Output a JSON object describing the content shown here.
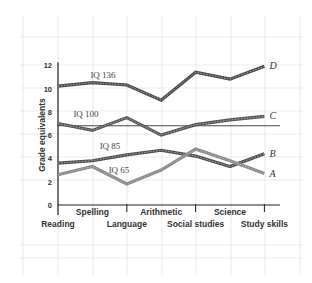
{
  "chart_data": {
    "type": "line",
    "title": "",
    "xlabel": "",
    "ylabel": "Grade equivalents",
    "ylim": [
      0,
      12
    ],
    "yticks": [
      0,
      2,
      4,
      6,
      8,
      10,
      12
    ],
    "grid": true,
    "categories": [
      "Reading",
      "Spelling",
      "Language",
      "Arithmetic",
      "Social studies",
      "Science",
      "Study skills"
    ],
    "reference_line": {
      "value": 6.8,
      "label": ""
    },
    "series": [
      {
        "name": "D",
        "iq_label": "IQ 136",
        "color": "#4a4a4a",
        "values": [
          10.2,
          10.5,
          10.3,
          9.0,
          11.4,
          10.8,
          11.9
        ]
      },
      {
        "name": "C",
        "iq_label": "IQ 100",
        "color": "#555555",
        "values": [
          7.0,
          6.4,
          7.5,
          6.0,
          6.9,
          7.3,
          7.6
        ]
      },
      {
        "name": "B",
        "iq_label": "IQ 85",
        "color": "#4f4f4f",
        "values": [
          3.6,
          3.8,
          4.3,
          4.7,
          4.2,
          3.3,
          4.4
        ]
      },
      {
        "name": "A",
        "iq_label": "IQ 65",
        "color": "#8a8a8a",
        "values": [
          2.6,
          3.3,
          1.8,
          3.0,
          4.8,
          3.8,
          2.7
        ]
      }
    ],
    "legend_position": "inline-right"
  }
}
